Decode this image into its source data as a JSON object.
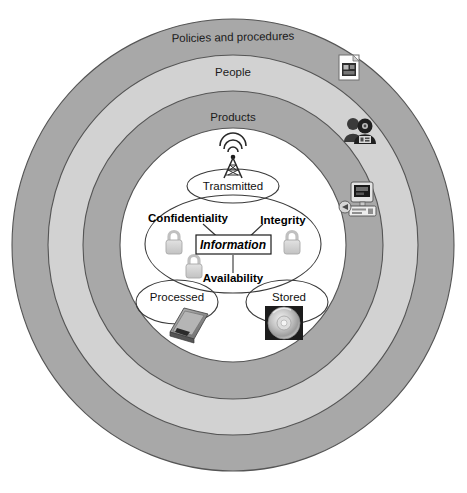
{
  "diagram": {
    "colors": {
      "ring_dark": "#a8a8a8",
      "ring_light": "#d2d2d2",
      "ring_stroke": "#5a5a5a",
      "core_fill": "#ffffff",
      "ellipse_stroke": "#3a3a3a",
      "lock_fill": "#d0d0d0",
      "lock_stroke": "#9a9a9a",
      "text": "#111111",
      "background": "#ffffff"
    },
    "rings": [
      {
        "id": "policies",
        "label": "Policies and procedures",
        "tone": "dark"
      },
      {
        "id": "people",
        "label": "People",
        "tone": "light"
      },
      {
        "id": "products",
        "label": "Products",
        "tone": "dark"
      }
    ],
    "core": {
      "states": [
        {
          "id": "transmitted",
          "label": "Transmitted",
          "icon": "radio-tower-icon"
        },
        {
          "id": "processed",
          "label": "Processed",
          "icon": "laptop-icon"
        },
        {
          "id": "stored",
          "label": "Stored",
          "icon": "optical-disc-icon"
        }
      ],
      "center_label": "Information",
      "triad": [
        {
          "id": "confidentiality",
          "label": "Confidentiality",
          "icon": "padlock-icon"
        },
        {
          "id": "integrity",
          "label": "Integrity",
          "icon": "padlock-icon"
        },
        {
          "id": "availability",
          "label": "Availability",
          "icon": "padlock-icon"
        }
      ]
    },
    "ring_icons": [
      {
        "id": "policy-document",
        "name": "document-icon",
        "ring": "policies"
      },
      {
        "id": "people-group",
        "name": "people-group-icon",
        "ring": "people"
      },
      {
        "id": "computer-product",
        "name": "computer-icon",
        "ring": "products"
      }
    ]
  }
}
